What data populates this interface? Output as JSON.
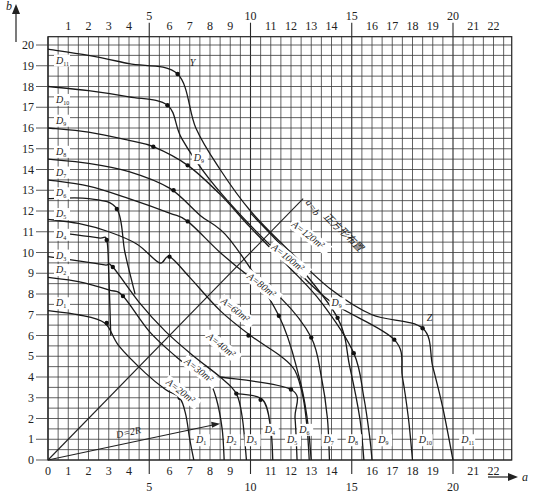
{
  "chart_data": {
    "type": "line",
    "title": "",
    "xlabel": "a",
    "ylabel": "b",
    "xlim": [
      0,
      22.9
    ],
    "ylim": [
      0,
      20.4
    ],
    "grid": true,
    "grid_step": 0.5,
    "x_ticks_bottom": [
      "0",
      "1",
      "2",
      "3",
      "4",
      "6",
      "7",
      "8",
      "9",
      "11",
      "12",
      "13",
      "14",
      "16",
      "17",
      "18",
      "19",
      "21",
      "22"
    ],
    "x_ticks_bottom_major": [
      "5",
      "10",
      "15",
      "20"
    ],
    "x_ticks_top": [
      "1",
      "2",
      "3",
      "4",
      "6",
      "7",
      "8",
      "9",
      "11",
      "12",
      "13",
      "14",
      "16",
      "17",
      "18",
      "19",
      "21",
      "22"
    ],
    "x_ticks_top_major": [
      "5",
      "10",
      "15",
      "20"
    ],
    "y_ticks": [
      "0",
      "1",
      "2",
      "3",
      "4",
      "5",
      "6",
      "7",
      "8",
      "9",
      "10",
      "11",
      "12",
      "13",
      "14",
      "15",
      "16",
      "17",
      "18",
      "19",
      "20"
    ],
    "diagonal": {
      "label": "a=b",
      "note": "正方形布置",
      "from": [
        0,
        0
      ],
      "to": [
        12.6,
        12.6
      ]
    },
    "radius_arrow": {
      "label": "D=2R",
      "from": [
        0,
        0
      ],
      "to": [
        8.5,
        1.75
      ]
    },
    "area_labels": [
      {
        "text": "A=20m²",
        "x": 5.8,
        "y": 3.7
      },
      {
        "text": "A=30m²",
        "x": 6.7,
        "y": 4.7
      },
      {
        "text": "A=40m²",
        "x": 7.8,
        "y": 5.9
      },
      {
        "text": "A=60m²",
        "x": 8.5,
        "y": 7.6
      },
      {
        "text": "A=80m²",
        "x": 9.8,
        "y": 8.8
      },
      {
        "text": "A=100m²",
        "x": 11.0,
        "y": 10.2
      },
      {
        "text": "A=120m²",
        "x": 12.0,
        "y": 11.3
      }
    ],
    "point_labels": [
      {
        "text": "Y",
        "x": 7.0,
        "y": 19.0
      },
      {
        "text": "Z",
        "x": 18.7,
        "y": 6.7
      },
      {
        "text": "D9",
        "x": 14.0,
        "y": 7.4
      },
      {
        "text": "D9",
        "x": 7.2,
        "y": 14.4
      }
    ],
    "left_d_labels": [
      {
        "name": "D11",
        "y": 19.3
      },
      {
        "name": "D10",
        "y": 17.4
      },
      {
        "name": "D9",
        "y": 16.4
      },
      {
        "name": "D8",
        "y": 14.9
      },
      {
        "name": "D7",
        "y": 13.9
      },
      {
        "name": "D6",
        "y": 12.9
      },
      {
        "name": "D5",
        "y": 11.9
      },
      {
        "name": "D4",
        "y": 10.9
      },
      {
        "name": "D3",
        "y": 9.9
      },
      {
        "name": "D2",
        "y": 9.2
      },
      {
        "name": "D1",
        "y": 7.6
      }
    ],
    "bottom_d_labels": [
      {
        "name": "D1",
        "x": 7.6
      },
      {
        "name": "D2",
        "x": 9.1
      },
      {
        "name": "D3",
        "x": 10.1
      },
      {
        "name": "D4",
        "x": 11.0,
        "y": 1.5
      },
      {
        "name": "D5",
        "x": 12.1
      },
      {
        "name": "D6",
        "x": 12.7,
        "y": 1.5
      },
      {
        "name": "D7",
        "x": 13.9
      },
      {
        "name": "D8",
        "x": 15.1
      },
      {
        "name": "D9",
        "x": 16.6
      },
      {
        "name": "D10",
        "x": 18.6
      },
      {
        "name": "D11",
        "x": 20.7
      }
    ],
    "series": [
      {
        "name": "A=20m²",
        "points": [
          [
            0,
            7.2
          ],
          [
            1.5,
            7.0
          ],
          [
            2.8,
            6.6
          ],
          [
            3.5,
            5.5
          ],
          [
            4.8,
            4.2
          ],
          [
            5.8,
            3.4
          ],
          [
            6.5,
            3.0
          ],
          [
            6.8,
            2.2
          ],
          [
            7.0,
            1.0
          ],
          [
            7.2,
            0
          ]
        ],
        "marks": [
          [
            2.9,
            6.6
          ],
          [
            6.5,
            3.0
          ]
        ]
      },
      {
        "name": "A=30m²",
        "points": [
          [
            0,
            8.8
          ],
          [
            1.5,
            8.6
          ],
          [
            3.0,
            8.2
          ],
          [
            3.7,
            7.9
          ],
          [
            5.0,
            6.2
          ],
          [
            6.3,
            5.0
          ],
          [
            7.2,
            4.3
          ],
          [
            7.9,
            3.9
          ],
          [
            8.3,
            3.0
          ],
          [
            8.6,
            1.5
          ],
          [
            8.7,
            0
          ]
        ],
        "marks": [
          [
            3.7,
            7.9
          ],
          [
            7.9,
            3.9
          ]
        ]
      },
      {
        "name": "A=40m²",
        "points": [
          [
            0,
            9.8
          ],
          [
            1.5,
            9.6
          ],
          [
            2.8,
            9.4
          ],
          [
            3.2,
            9.3
          ],
          [
            4.5,
            7.6
          ],
          [
            5.8,
            6.2
          ],
          [
            7.2,
            5.0
          ],
          [
            8.5,
            4.0
          ],
          [
            9.3,
            3.2
          ],
          [
            9.6,
            2.0
          ],
          [
            9.8,
            0
          ]
        ],
        "marks": [
          [
            3.2,
            9.3
          ],
          [
            9.3,
            3.2
          ]
        ]
      },
      {
        "name": "A=60m²",
        "points": [
          [
            0,
            11.6
          ],
          [
            1.5,
            11.4
          ],
          [
            3.0,
            11.0
          ],
          [
            4.4,
            10.4
          ],
          [
            5.5,
            9.5
          ],
          [
            6.0,
            9.8
          ],
          [
            7.0,
            8.8
          ],
          [
            8.5,
            7.2
          ],
          [
            10.0,
            6.0
          ],
          [
            11.5,
            5.0
          ],
          [
            12.2,
            4.3
          ],
          [
            12.6,
            3.0
          ],
          [
            12.8,
            1.5
          ],
          [
            12.9,
            0
          ]
        ],
        "marks": [
          [
            6.0,
            9.8
          ],
          [
            9.9,
            6.0
          ]
        ]
      },
      {
        "name": "A=80m²",
        "points": [
          [
            0,
            13.5
          ],
          [
            2.0,
            13.2
          ],
          [
            4.0,
            12.6
          ],
          [
            6.0,
            11.9
          ],
          [
            6.9,
            11.5
          ],
          [
            8.5,
            10.0
          ],
          [
            10.0,
            8.8
          ],
          [
            11.5,
            7.8
          ],
          [
            13.0,
            5.9
          ],
          [
            13.5,
            4.0
          ],
          [
            13.8,
            2.0
          ],
          [
            13.9,
            0
          ]
        ],
        "marks": [
          [
            6.9,
            11.5
          ],
          [
            13.0,
            5.9
          ]
        ]
      },
      {
        "name": "A=100m²",
        "points": [
          [
            0,
            14.5
          ],
          [
            2.0,
            14.3
          ],
          [
            4.0,
            13.9
          ],
          [
            6.0,
            13.1
          ],
          [
            7.5,
            11.8
          ],
          [
            9.0,
            10.6
          ],
          [
            11.4,
            6.95
          ],
          [
            12.4,
            4.0
          ],
          [
            12.8,
            2.0
          ],
          [
            13.0,
            0
          ]
        ],
        "marks": [
          [
            6.2,
            13.0
          ],
          [
            11.4,
            6.95
          ]
        ]
      },
      {
        "name": "A=120m²",
        "points": [
          [
            0,
            16.0
          ],
          [
            2.0,
            15.8
          ],
          [
            4.0,
            15.4
          ],
          [
            5.2,
            15.1
          ],
          [
            6.9,
            14.2
          ],
          [
            8.5,
            12.8
          ],
          [
            10.0,
            11.2
          ],
          [
            11.8,
            9.4
          ],
          [
            13.5,
            7.6
          ],
          [
            15.1,
            5.15
          ],
          [
            15.6,
            3.0
          ],
          [
            15.9,
            1.0
          ],
          [
            16.0,
            0
          ]
        ],
        "marks": [
          [
            5.2,
            15.1
          ],
          [
            6.9,
            14.2
          ],
          [
            15.1,
            5.15
          ]
        ]
      },
      {
        "name": "upper-D10",
        "points": [
          [
            0,
            18.0
          ],
          [
            2.0,
            17.8
          ],
          [
            4.0,
            17.5
          ],
          [
            5.9,
            17.1
          ],
          [
            6.6,
            15.5
          ],
          [
            8.0,
            13.5
          ],
          [
            10.0,
            11.3
          ],
          [
            12.0,
            9.4
          ],
          [
            14.0,
            7.6
          ],
          [
            17.1,
            5.8
          ],
          [
            17.5,
            4.0
          ],
          [
            17.8,
            2.0
          ],
          [
            18.0,
            0
          ]
        ],
        "marks": [
          [
            5.9,
            17.1
          ],
          [
            17.1,
            5.8
          ]
        ]
      },
      {
        "name": "Y-Z",
        "points": [
          [
            0,
            19.8
          ],
          [
            2.0,
            19.5
          ],
          [
            4.0,
            19.1
          ],
          [
            6.4,
            18.6
          ],
          [
            7.3,
            16.0
          ],
          [
            8.5,
            14.0
          ],
          [
            10.0,
            12.0
          ],
          [
            12.0,
            10.0
          ],
          [
            14.0,
            8.2
          ],
          [
            16.0,
            7.0
          ],
          [
            18.5,
            6.35
          ],
          [
            19.0,
            4.5
          ],
          [
            19.5,
            2.5
          ],
          [
            20.0,
            0
          ]
        ],
        "marks": [
          [
            6.4,
            18.6
          ],
          [
            18.5,
            6.35
          ]
        ]
      },
      {
        "name": "D9 right",
        "points": [
          [
            10.0,
            11.9
          ],
          [
            12.0,
            9.8
          ],
          [
            14.3,
            6.85
          ],
          [
            14.9,
            4.5
          ],
          [
            15.4,
            2.0
          ],
          [
            15.6,
            0
          ]
        ],
        "marks": [
          [
            14.3,
            6.85
          ]
        ]
      },
      {
        "name": "D4 left",
        "points": [
          [
            1.0,
            10.9
          ],
          [
            2.5,
            10.7
          ],
          [
            2.9,
            10.6
          ],
          [
            3.0,
            9.0
          ],
          [
            3.1,
            6.0
          ]
        ],
        "marks": [
          [
            2.9,
            10.6
          ]
        ]
      },
      {
        "name": "D5 left",
        "points": [
          [
            0,
            12.6
          ],
          [
            2.0,
            12.6
          ],
          [
            3.4,
            12.1
          ],
          [
            3.8,
            10.0
          ],
          [
            4.3,
            8.0
          ]
        ],
        "marks": [
          [
            3.4,
            12.1
          ]
        ]
      },
      {
        "name": "A=20/30 tail",
        "points": [
          [
            9.3,
            3.2
          ],
          [
            10.6,
            2.9
          ],
          [
            11.0,
            1.5
          ],
          [
            11.1,
            0
          ]
        ],
        "marks": [
          [
            10.5,
            2.9
          ]
        ]
      },
      {
        "name": "A=40 tail",
        "points": [
          [
            8.5,
            4.0
          ],
          [
            12.0,
            3.4
          ],
          [
            12.2,
            2.0
          ],
          [
            12.3,
            0
          ]
        ],
        "marks": [
          [
            12.0,
            3.4
          ]
        ]
      }
    ]
  }
}
